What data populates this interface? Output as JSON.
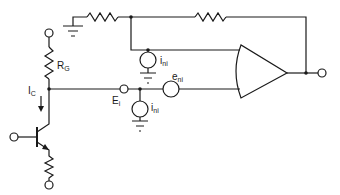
{
  "diagram": {
    "type": "circuit-schematic",
    "colors": {
      "ink": "#1a1a1a",
      "background": "#ffffff"
    },
    "labels": {
      "rg": {
        "main": "R",
        "sub": "G"
      },
      "ic": {
        "main": "I",
        "sub": "C"
      },
      "ei": {
        "main": "E",
        "sub": "i"
      },
      "eni": {
        "main": "e",
        "sub": "ni"
      },
      "ini_top": {
        "main": "i",
        "sub": "ni"
      },
      "ini_bottom": {
        "main": "i",
        "sub": "ni"
      }
    },
    "components": [
      {
        "id": "ground-top-left",
        "kind": "ground"
      },
      {
        "id": "feedback-resistor-1",
        "kind": "resistor"
      },
      {
        "id": "feedback-resistor-2",
        "kind": "resistor"
      },
      {
        "id": "current-source-ini-top",
        "kind": "current-source",
        "label": "i_ni"
      },
      {
        "id": "op-amp",
        "kind": "op-amp"
      },
      {
        "id": "resistor-rg",
        "kind": "resistor",
        "label": "R_G"
      },
      {
        "id": "input-terminal-ei",
        "kind": "terminal",
        "label": "E_i"
      },
      {
        "id": "voltage-source-eni",
        "kind": "voltage-source",
        "label": "e_ni"
      },
      {
        "id": "current-source-ini-bottom",
        "kind": "current-source",
        "label": "i_ni"
      },
      {
        "id": "npn-transistor",
        "kind": "transistor",
        "label": "I_C"
      },
      {
        "id": "emitter-resistor",
        "kind": "resistor"
      }
    ]
  }
}
